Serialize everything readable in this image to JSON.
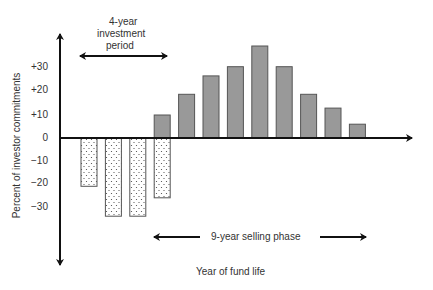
{
  "chart_data": {
    "type": "bar",
    "title": "",
    "xlabel": "Year of fund life",
    "ylabel": "Percent of investor commitments",
    "ylim": [
      -40,
      42
    ],
    "yticks": [
      "+30",
      "+20",
      "+10",
      "0",
      "−10",
      "−20",
      "−30"
    ],
    "ytick_values": [
      30,
      20,
      10,
      0,
      -10,
      -20,
      -30
    ],
    "grid": false,
    "legend": null,
    "series": [
      {
        "name": "Capital calls (investment)",
        "style": "dotted",
        "color": "#ffffff",
        "categories": [
          1,
          2,
          3,
          4
        ],
        "values": [
          -21,
          -34,
          -34,
          -26
        ]
      },
      {
        "name": "Distributions (selling)",
        "style": "solid",
        "color": "#999999",
        "categories": [
          4,
          5,
          6,
          7,
          8,
          9,
          10,
          11,
          12
        ],
        "values": [
          10,
          19,
          27,
          31,
          40,
          31,
          19,
          13,
          6
        ]
      }
    ],
    "annotations": [
      {
        "text": "4-year investment period",
        "lines": [
          "4-year",
          "investment",
          "period"
        ],
        "type": "double-arrow",
        "span_years": [
          1,
          4
        ]
      },
      {
        "text": "9-year selling phase",
        "type": "double-arrow",
        "span_years": [
          4,
          12
        ]
      }
    ]
  },
  "labels": {
    "ylabel": "Percent of investor commitments",
    "xlabel": "Year of fund life",
    "invest_line1": "4-year",
    "invest_line2": "investment",
    "invest_line3": "period",
    "selling": "9-year selling phase",
    "ticks": [
      "+30",
      "+20",
      "+10",
      "0",
      "−10",
      "−20",
      "−30"
    ]
  }
}
